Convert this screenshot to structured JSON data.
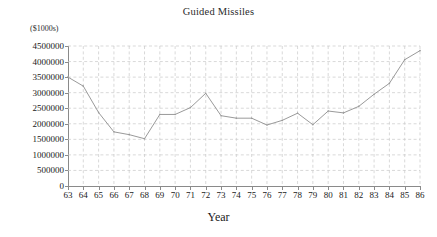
{
  "chart_data": {
    "type": "line",
    "title": "Guided Missiles",
    "xlabel": "Year",
    "ylabel": "($1000s)",
    "x": [
      "63",
      "64",
      "65",
      "66",
      "67",
      "68",
      "69",
      "70",
      "71",
      "72",
      "73",
      "74",
      "75",
      "76",
      "77",
      "78",
      "79",
      "80",
      "81",
      "82",
      "83",
      "84",
      "85",
      "86"
    ],
    "categories": [
      "63",
      "64",
      "65",
      "66",
      "67",
      "68",
      "69",
      "70",
      "71",
      "72",
      "73",
      "74",
      "75",
      "76",
      "77",
      "78",
      "79",
      "80",
      "81",
      "82",
      "83",
      "84",
      "85",
      "86"
    ],
    "values": [
      3500000,
      3210000,
      2360000,
      1740000,
      1650000,
      1520000,
      2300000,
      2300000,
      2520000,
      2980000,
      2260000,
      2180000,
      2180000,
      1960000,
      2110000,
      2340000,
      1970000,
      2410000,
      2350000,
      2560000,
      2950000,
      3300000,
      4060000,
      4350000
    ],
    "series": [
      {
        "name": "Guided Missiles",
        "values": [
          3500000,
          3210000,
          2360000,
          1740000,
          1650000,
          1520000,
          2300000,
          2300000,
          2520000,
          2980000,
          2260000,
          2180000,
          2180000,
          1960000,
          2110000,
          2340000,
          1970000,
          2410000,
          2350000,
          2560000,
          2950000,
          3300000,
          4060000,
          4350000
        ]
      }
    ],
    "ylim": [
      0,
      4500000
    ],
    "ytick_labels": [
      "4500000",
      "4000000",
      "3500000",
      "3000000",
      "2500000",
      "2000000",
      "1500000",
      "1000000",
      "500000",
      "0"
    ],
    "ytick_values": [
      4500000,
      4000000,
      3500000,
      3000000,
      2500000,
      2000000,
      1500000,
      1000000,
      500000,
      0
    ],
    "grid": true,
    "grid_style": "dashed",
    "legend": "none",
    "line_color": "#9a9a9a",
    "grid_color": "#c9c9c9",
    "axis_color": "#8a8a8a"
  }
}
